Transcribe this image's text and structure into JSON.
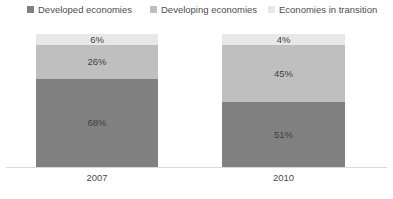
{
  "chart_data": {
    "type": "bar",
    "subtype": "100% stacked column",
    "title": "",
    "subtitle": "",
    "xlabel": "",
    "ylabel": "",
    "ylim": [
      0,
      100
    ],
    "grid": false,
    "legend_position": "top",
    "value_suffix": "%",
    "categories": [
      "2007",
      "2010"
    ],
    "series": [
      {
        "name": "Developed economies",
        "color": "#808080",
        "values": [
          68,
          51
        ],
        "labels": [
          "68%",
          "51%"
        ]
      },
      {
        "name": "Developing economies",
        "color": "#bfbfbf",
        "values": [
          26,
          45
        ],
        "labels": [
          "26%",
          "45%"
        ]
      },
      {
        "name": "Economies in transition",
        "color": "#e8e8e8",
        "values": [
          6,
          4
        ],
        "labels": [
          "6%",
          "4%"
        ]
      }
    ],
    "stack_order_bottom_to_top": [
      "Developed economies",
      "Developing economies",
      "Economies in transition"
    ]
  },
  "legend": {
    "items": [
      {
        "label": "Developed economies",
        "color": "#808080"
      },
      {
        "label": "Developing economies",
        "color": "#bfbfbf"
      },
      {
        "label": "Economies in transition",
        "color": "#e8e8e8"
      }
    ]
  },
  "axis": {
    "categories": [
      "2007",
      "2010"
    ],
    "baseline_color": "#d9d9d9"
  },
  "bars": [
    {
      "category": "2007",
      "segments": [
        {
          "series": "Economies in transition",
          "label": "6%",
          "value": 6,
          "color": "#e8e8e8"
        },
        {
          "series": "Developing economies",
          "label": "26%",
          "value": 26,
          "color": "#bfbfbf"
        },
        {
          "series": "Developed economies",
          "label": "68%",
          "value": 68,
          "color": "#808080"
        }
      ]
    },
    {
      "category": "2010",
      "segments": [
        {
          "series": "Economies in transition",
          "label": "4%",
          "value": 4,
          "color": "#e8e8e8"
        },
        {
          "series": "Developing economies",
          "label": "45%",
          "value": 45,
          "color": "#bfbfbf"
        },
        {
          "series": "Developed economies",
          "label": "51%",
          "value": 51,
          "color": "#808080"
        }
      ]
    }
  ]
}
